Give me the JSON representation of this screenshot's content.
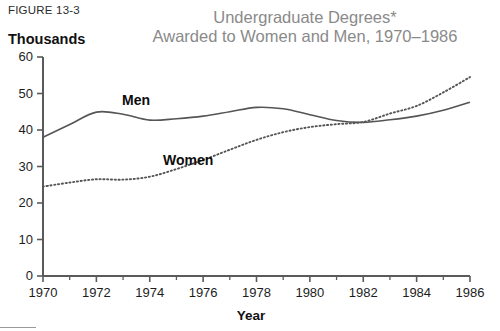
{
  "figure": {
    "caption": "FIGURE 13-3",
    "unit_label": "Thousands",
    "title_line_1": "Undergraduate Degrees*",
    "title_line_2": "Awarded to Women and Men, 1970–1986",
    "title_color": "#8a8a8a",
    "axis_color": "#5a5a5a",
    "men_color": "#555555",
    "women_color": "#555555"
  },
  "chart_data": {
    "type": "line",
    "title": "Undergraduate Degrees* Awarded to Women and Men, 1970–1986",
    "xlabel": "Year",
    "ylabel": "Thousands",
    "xlim": [
      1970,
      1986
    ],
    "ylim": [
      0,
      60
    ],
    "ytick_labels": [
      "0",
      "10",
      "20",
      "30",
      "40",
      "50",
      "60"
    ],
    "ytick_values": [
      0,
      10,
      20,
      30,
      40,
      50,
      60
    ],
    "xtick_labels": [
      "1970",
      "1972",
      "1974",
      "1976",
      "1978",
      "1980",
      "1982",
      "1984",
      "1986"
    ],
    "xtick_values": [
      1970,
      1972,
      1974,
      1976,
      1978,
      1980,
      1982,
      1984,
      1986
    ],
    "xtick_minor_values": [
      1971,
      1973,
      1975,
      1977,
      1979,
      1981,
      1983,
      1985
    ],
    "grid": false,
    "legend": "inline-series-labels",
    "x": [
      1970,
      1971,
      1972,
      1973,
      1974,
      1975,
      1976,
      1977,
      1978,
      1979,
      1980,
      1981,
      1982,
      1983,
      1984,
      1985,
      1986
    ],
    "series": [
      {
        "name": "Men",
        "style": "solid",
        "label_text": "Men",
        "values": [
          38.0,
          41.5,
          44.9,
          44.3,
          42.7,
          43.1,
          43.8,
          45.0,
          46.2,
          45.8,
          44.2,
          42.6,
          42.1,
          42.8,
          43.8,
          45.4,
          47.6
        ]
      },
      {
        "name": "Women",
        "style": "dotted",
        "label_text": "Women",
        "values": [
          24.5,
          25.6,
          26.5,
          26.4,
          27.2,
          29.3,
          31.8,
          34.6,
          37.3,
          39.4,
          40.8,
          41.6,
          42.2,
          44.5,
          46.6,
          50.3,
          54.5
        ]
      }
    ]
  }
}
